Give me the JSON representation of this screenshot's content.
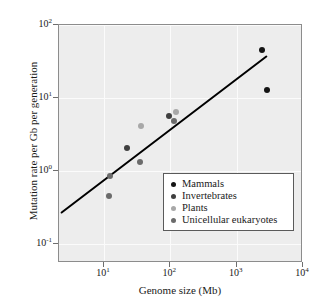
{
  "chart_data": {
    "type": "scatter",
    "title": "",
    "xlabel": "Genome size (Mb)",
    "ylabel": "Mutation rate per Gb per generation",
    "xscale": "log",
    "yscale": "log",
    "xlim": [
      2.1,
      10000
    ],
    "ylim": [
      0.055,
      100
    ],
    "grid": true,
    "legend_position": "lower right",
    "xticks": [
      {
        "value": 10,
        "label": "10",
        "exponent": "1"
      },
      {
        "value": 100,
        "label": "10",
        "exponent": "2"
      },
      {
        "value": 1000,
        "label": "10",
        "exponent": "3"
      },
      {
        "value": 10000,
        "label": "10",
        "exponent": "4"
      }
    ],
    "yticks": [
      {
        "value": 100,
        "label": "10",
        "exponent": "2"
      },
      {
        "value": 10,
        "label": "10",
        "exponent": "1"
      },
      {
        "value": 1,
        "label": "10",
        "exponent": "0"
      },
      {
        "value": 0.1,
        "label": "10",
        "exponent": "-1"
      }
    ],
    "series": [
      {
        "name": "Mammals",
        "color": "#141414",
        "points": [
          {
            "x": 2400,
            "y": 46
          },
          {
            "x": 2900,
            "y": 13
          }
        ]
      },
      {
        "name": "Invertebrates",
        "color": "#3f3f3f",
        "points": [
          {
            "x": 22,
            "y": 2.1
          },
          {
            "x": 95,
            "y": 5.7
          }
        ]
      },
      {
        "name": "Plants",
        "color": "#a8a8a8",
        "points": [
          {
            "x": 120,
            "y": 6.5
          },
          {
            "x": 36,
            "y": 4.2
          }
        ]
      },
      {
        "name": "Unicellular eukaryotes",
        "color": "#6b6b6b",
        "points": [
          {
            "x": 12,
            "y": 0.45
          },
          {
            "x": 12.5,
            "y": 0.85
          },
          {
            "x": 35,
            "y": 1.35
          },
          {
            "x": 115,
            "y": 4.9
          }
        ]
      }
    ],
    "trendline": {
      "type": "linear-on-log-log",
      "x_start": 2.3,
      "y_start": 0.27,
      "x_end": 2800,
      "y_end": 37,
      "color": "#000000",
      "width": 2
    },
    "legend": {
      "entries": [
        {
          "label": "Mammals",
          "color": "#141414"
        },
        {
          "label": "Invertebrates",
          "color": "#3f3f3f"
        },
        {
          "label": "Plants",
          "color": "#a8a8a8"
        },
        {
          "label": "Unicellular eukaryotes",
          "color": "#6b6b6b"
        }
      ]
    }
  }
}
